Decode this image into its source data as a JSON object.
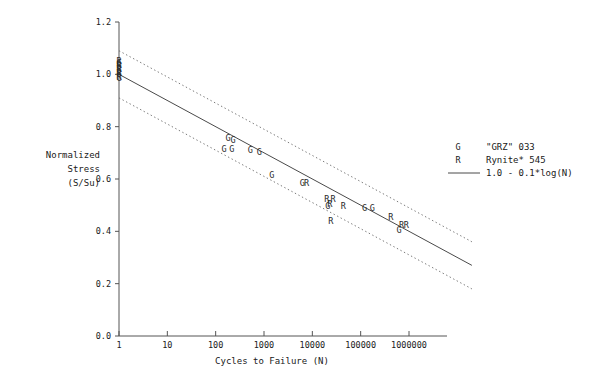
{
  "chart_data": {
    "type": "scatter",
    "title": "",
    "xlabel": "Cycles to Failure (N)",
    "ylabel_lines": [
      "Normalized",
      "Stress",
      "(S/Su)"
    ],
    "x_scale": "log",
    "y_scale": "linear",
    "xlim": [
      1,
      10000000
    ],
    "ylim": [
      0.0,
      1.2
    ],
    "grid": false,
    "x_ticks": [
      "1",
      "10",
      "100",
      "1000",
      "10000",
      "100000",
      "1000000"
    ],
    "x_tick_values": [
      1,
      10,
      100,
      1000,
      10000,
      100000,
      1000000
    ],
    "y_ticks": [
      "0.0",
      "0.2",
      "0.4",
      "0.6",
      "0.8",
      "1.0",
      "1.2"
    ],
    "y_tick_values": [
      0.0,
      0.2,
      0.4,
      0.6,
      0.8,
      1.0,
      1.2
    ],
    "legend_position": "right",
    "legend": [
      {
        "marker": "G",
        "label": "\"GRZ\" 033"
      },
      {
        "marker": "R",
        "label": "Rynite* 545"
      },
      {
        "marker": "line",
        "label": "1.0 - 0.1*log(N)"
      }
    ],
    "fit": {
      "equation": "1.0 - 0.1*log(N)",
      "intercept": 1.0,
      "slope_per_decade": -0.1,
      "x_start": 1,
      "x_end": 20000000,
      "y_start": 1.0,
      "y_end": 0.27
    },
    "bands": [
      {
        "name": "upper-confidence-band",
        "style": "dotted",
        "offset": 0.09,
        "x_start": 1,
        "x_end": 20000000,
        "y_start": 1.09,
        "y_end": 0.36
      },
      {
        "name": "lower-confidence-band",
        "style": "dotted",
        "offset": -0.09,
        "x_start": 1,
        "x_end": 20000000,
        "y_start": 0.91,
        "y_end": 0.18
      }
    ],
    "series": [
      {
        "name": "\"GRZ\" 033",
        "marker": "G",
        "points": [
          {
            "x": 1,
            "y": 1.045
          },
          {
            "x": 1,
            "y": 1.03
          },
          {
            "x": 1,
            "y": 1.015
          },
          {
            "x": 1,
            "y": 1.0
          },
          {
            "x": 1,
            "y": 0.985
          },
          {
            "x": 180,
            "y": 0.755
          },
          {
            "x": 230,
            "y": 0.75
          },
          {
            "x": 150,
            "y": 0.715
          },
          {
            "x": 215,
            "y": 0.715
          },
          {
            "x": 520,
            "y": 0.712
          },
          {
            "x": 800,
            "y": 0.705
          },
          {
            "x": 1450,
            "y": 0.615
          },
          {
            "x": 6200,
            "y": 0.585
          },
          {
            "x": 21000,
            "y": 0.495
          },
          {
            "x": 120000,
            "y": 0.49
          },
          {
            "x": 175000,
            "y": 0.49
          },
          {
            "x": 620000,
            "y": 0.405
          }
        ]
      },
      {
        "name": "Rynite* 545",
        "marker": "R",
        "points": [
          {
            "x": 1,
            "y": 1.05
          },
          {
            "x": 1,
            "y": 1.035
          },
          {
            "x": 1,
            "y": 1.02
          },
          {
            "x": 1,
            "y": 1.005
          },
          {
            "x": 1,
            "y": 0.99
          },
          {
            "x": 7600,
            "y": 0.585
          },
          {
            "x": 20000,
            "y": 0.525
          },
          {
            "x": 27000,
            "y": 0.525
          },
          {
            "x": 23000,
            "y": 0.505
          },
          {
            "x": 44000,
            "y": 0.495
          },
          {
            "x": 24000,
            "y": 0.44
          },
          {
            "x": 420000,
            "y": 0.455
          },
          {
            "x": 700000,
            "y": 0.425
          },
          {
            "x": 880000,
            "y": 0.425
          }
        ]
      }
    ]
  }
}
